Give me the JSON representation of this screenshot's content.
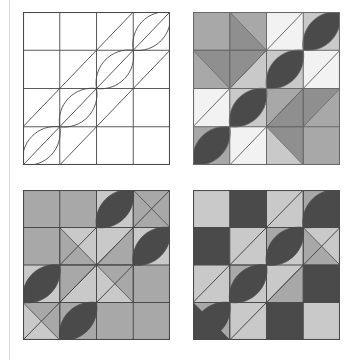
{
  "figure": {
    "background_color": "#ffffff",
    "margin_rule_color": "#d8d8d8",
    "panel_count": 4,
    "grid_divisions": 4
  },
  "palette": {
    "outline": "#3a3a3a",
    "line_thin": "#5a5a5a",
    "white": "#ffffff",
    "light": "#f0f0f0",
    "light_gray": "#c9c9c9",
    "mid_gray": "#a8a8a8",
    "dark_gray": "#8f8f8f",
    "darkest": "#4a4a4a",
    "near_black": "#454545"
  },
  "panels": [
    {
      "id": "panel-top-left",
      "label": "Line drawing block",
      "position": "top-left",
      "x": 23,
      "y": 12,
      "width": 147,
      "height": 153,
      "style": "outline-only",
      "fill_mode": "none",
      "stroke_color": "#4a4a4a",
      "background": "#ffffff",
      "features": [
        "square-grid",
        "ascending-diagonals",
        "leaf-lens-shapes"
      ],
      "cells": [
        [
          "#ffffff",
          "#ffffff",
          "#ffffff",
          "#ffffff"
        ],
        [
          "#ffffff",
          "#ffffff",
          "#ffffff",
          "#ffffff"
        ],
        [
          "#ffffff",
          "#ffffff",
          "#ffffff",
          "#ffffff"
        ],
        [
          "#ffffff",
          "#ffffff",
          "#ffffff",
          "#ffffff"
        ]
      ]
    },
    {
      "id": "panel-top-right",
      "label": "Four-tone pinwheel coloring",
      "position": "top-right",
      "x": 193,
      "y": 12,
      "width": 147,
      "height": 153,
      "style": "filled",
      "fill_mode": "four-tone",
      "stroke_color": "#6a6a6a",
      "background": "#a8a8a8",
      "features": [
        "square-grid",
        "half-square-triangles",
        "leaf-lens-shapes",
        "white-accent-squares"
      ],
      "cells": [
        [
          "#a8a8a8",
          "#a8a8a8",
          "#f2f2f2",
          "#c9c9c9"
        ],
        [
          "#a8a8a8",
          "#c9c9c9",
          "#c9c9c9",
          "#f2f2f2"
        ],
        [
          "#f2f2f2",
          "#c9c9c9",
          "#a8a8a8",
          "#a8a8a8"
        ],
        [
          "#a8a8a8",
          "#f2f2f2",
          "#c9c9c9",
          "#a8a8a8"
        ]
      ],
      "triangles": [
        {
          "cell": "r0c1",
          "corner": "lower-left",
          "color": "#8f8f8f"
        },
        {
          "cell": "r1c0",
          "corner": "upper-right",
          "color": "#8f8f8f"
        },
        {
          "cell": "r1c1",
          "corner": "upper-left",
          "color": "#8f8f8f"
        },
        {
          "cell": "r2c2",
          "corner": "lower-right",
          "color": "#8f8f8f"
        },
        {
          "cell": "r3c2",
          "corner": "upper-right",
          "color": "#8f8f8f"
        },
        {
          "cell": "r2c3",
          "corner": "upper-left",
          "color": "#8f8f8f"
        }
      ],
      "leaves": [
        {
          "at": "r0c3",
          "color": "#4a4a4a"
        },
        {
          "at": "r1c2",
          "color": "#4a4a4a"
        },
        {
          "at": "r2c1",
          "color": "#4a4a4a"
        },
        {
          "at": "r3c0",
          "color": "#4a4a4a"
        }
      ]
    },
    {
      "id": "panel-bottom-left",
      "label": "Central diamond coloring",
      "position": "bottom-left",
      "x": 23,
      "y": 190,
      "width": 147,
      "height": 150,
      "style": "filled",
      "fill_mode": "two-tone-gray",
      "stroke_color": "#4a4a4a",
      "background": "#a8a8a8",
      "features": [
        "square-grid",
        "central-diamond",
        "half-square-triangles",
        "leaf-lens-shapes"
      ],
      "cells": [
        [
          "#a8a8a8",
          "#a8a8a8",
          "#c9c9c9",
          "#a8a8a8"
        ],
        [
          "#a8a8a8",
          "#c9c9c9",
          "#c9c9c9",
          "#c9c9c9"
        ],
        [
          "#c9c9c9",
          "#c9c9c9",
          "#c9c9c9",
          "#a8a8a8"
        ],
        [
          "#c9c9c9",
          "#a8a8a8",
          "#a8a8a8",
          "#a8a8a8"
        ]
      ],
      "triangles": [
        {
          "cell": "r0c3",
          "corner": "lower-left",
          "color": "#a8a8a8"
        },
        {
          "cell": "r1c1",
          "corner": "lower-left",
          "color": "#a8a8a8"
        },
        {
          "cell": "r1c2",
          "corner": "lower-right",
          "color": "#a8a8a8"
        },
        {
          "cell": "r2c1",
          "corner": "upper-left",
          "color": "#a8a8a8"
        },
        {
          "cell": "r2c2",
          "corner": "upper-right",
          "color": "#a8a8a8"
        },
        {
          "cell": "r3c0",
          "corner": "upper-right",
          "color": "#a8a8a8"
        }
      ],
      "leaves": [
        {
          "at": "r0c2",
          "color": "#4a4a4a"
        },
        {
          "at": "r1c3",
          "color": "#4a4a4a"
        },
        {
          "at": "r2c0",
          "color": "#4a4a4a"
        },
        {
          "at": "r3c1",
          "color": "#4a4a4a"
        }
      ]
    },
    {
      "id": "panel-bottom-right",
      "label": "Checkerboard coloring",
      "position": "bottom-right",
      "x": 193,
      "y": 190,
      "width": 147,
      "height": 150,
      "style": "filled",
      "fill_mode": "checkerboard",
      "stroke_color": "#4a4a4a",
      "background": "#c9c9c9",
      "features": [
        "checkerboard",
        "diagonal-band",
        "leaf-lens-shapes"
      ],
      "cells": [
        [
          "#c9c9c9",
          "#4a4a4a",
          "#c9c9c9",
          "#4a4a4a"
        ],
        [
          "#4a4a4a",
          "#c9c9c9",
          "#c9c9c9",
          "#c9c9c9"
        ],
        [
          "#c9c9c9",
          "#c9c9c9",
          "#c9c9c9",
          "#4a4a4a"
        ],
        [
          "#4a4a4a",
          "#c9c9c9",
          "#4a4a4a",
          "#c9c9c9"
        ]
      ],
      "triangles": [
        {
          "cell": "r0c3",
          "corner": "upper-left",
          "color": "#a8a8a8"
        },
        {
          "cell": "r1c2",
          "corner": "upper-left",
          "color": "#a8a8a8"
        },
        {
          "cell": "r1c3",
          "corner": "lower-left",
          "color": "#a8a8a8"
        },
        {
          "cell": "r2c1",
          "corner": "upper-left",
          "color": "#a8a8a8"
        },
        {
          "cell": "r2c2",
          "corner": "lower-right",
          "color": "#a8a8a8"
        },
        {
          "cell": "r3c0",
          "corner": "upper-right",
          "color": "#a8a8a8"
        }
      ],
      "leaves": [
        {
          "at": "r0c3",
          "color": "#4a4a4a"
        },
        {
          "at": "r1c2",
          "color": "#4a4a4a"
        },
        {
          "at": "r2c1",
          "color": "#4a4a4a"
        },
        {
          "at": "r3c0",
          "color": "#4a4a4a"
        }
      ]
    }
  ]
}
